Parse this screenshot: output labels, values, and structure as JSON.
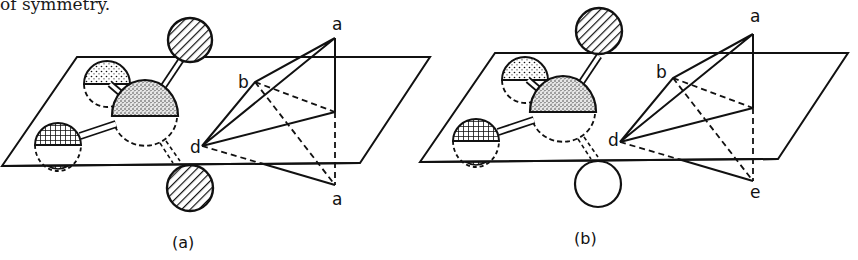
{
  "header": {
    "text_fragment": "of symmetry."
  },
  "panels": [
    {
      "id": "a",
      "caption": "(a)",
      "vertex_labels": {
        "top": "a",
        "left_upper": "b",
        "left": "d",
        "bottom": "a"
      },
      "atoms": {
        "top_atom": "hatched",
        "bottom_atom": "hatched",
        "upper_left_atom": "dotted",
        "center_atom": "stippled",
        "left_atom": "crosshatched"
      }
    },
    {
      "id": "b",
      "caption": "(b)",
      "vertex_labels": {
        "top": "a",
        "left_upper": "b",
        "left": "d",
        "bottom": "e"
      },
      "atoms": {
        "top_atom": "hatched",
        "bottom_atom": "empty",
        "upper_left_atom": "dotted",
        "center_atom": "stippled",
        "left_atom": "crosshatched"
      }
    }
  ],
  "colors": {
    "ink": "#111111",
    "background": "#ffffff"
  }
}
